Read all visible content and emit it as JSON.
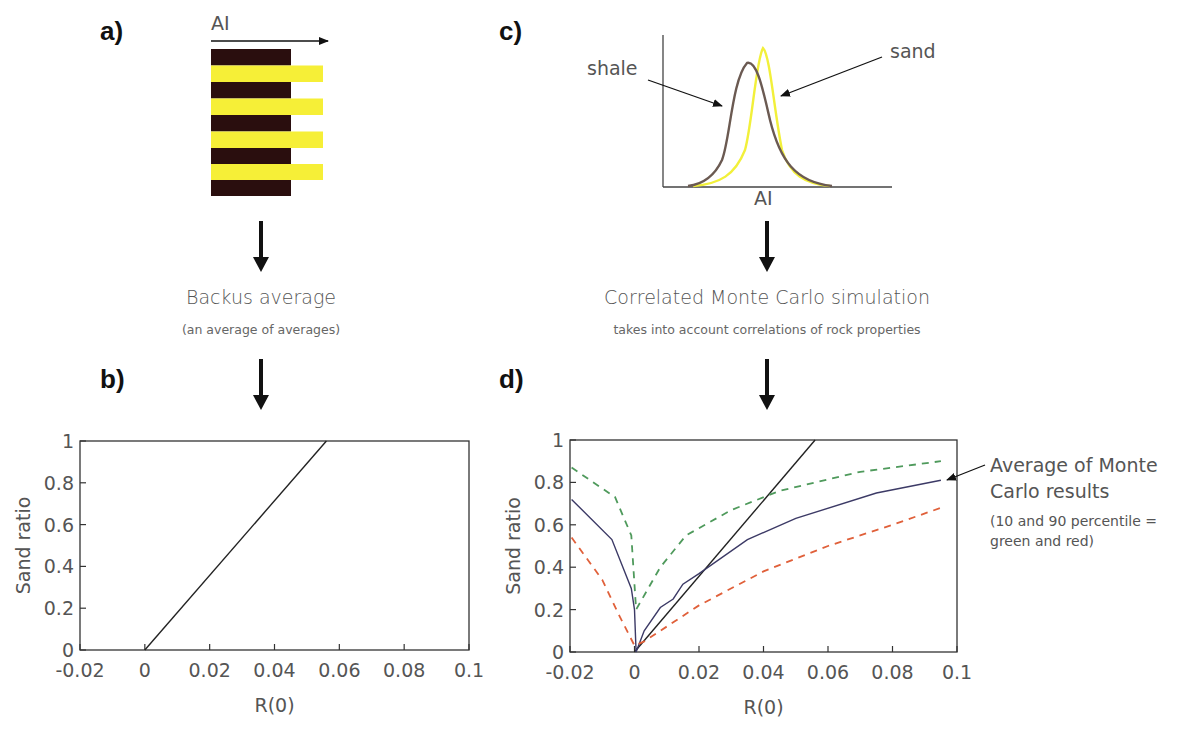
{
  "panels": {
    "a": {
      "label": "a)",
      "axis_label": "AI"
    },
    "b": {
      "label": "b)"
    },
    "c": {
      "label": "c)",
      "axis_label": "AI",
      "shale_label": "shale",
      "sand_label": "sand"
    },
    "d": {
      "label": "d)"
    }
  },
  "flow": {
    "left": {
      "title": "Backus average",
      "subtitle": "(an average of averages)"
    },
    "right": {
      "title": "Correlated Monte Carlo simulation",
      "subtitle": "takes into account correlations of rock properties"
    }
  },
  "annotation": {
    "line1": "Average of Monte",
    "line2": "Carlo results",
    "line3": "(10 and 90 percentile =",
    "line4": "green and red)"
  },
  "colors": {
    "shale": "#6b5a52",
    "sand": "#f2f03a",
    "dark_layer": "#2a0e0e",
    "yellow_layer": "#f6ef37",
    "avg_line": "#3c3a66",
    "p10_line": "#4f9a5c",
    "p90_line": "#e0603a",
    "backus_line": "#222222"
  },
  "chart_data": [
    {
      "id": "a",
      "type": "diagram",
      "title": "Layered shale/sand model",
      "xlabel": "AI",
      "layers": [
        "shale",
        "sand",
        "shale",
        "sand",
        "shale",
        "sand",
        "shale",
        "sand",
        "shale"
      ],
      "note": "Sand layers (yellow) have higher AI than shale layers (dark)"
    },
    {
      "id": "b",
      "type": "line",
      "title": "Backus average",
      "xlabel": "R(0)",
      "ylabel": "Sand ratio",
      "xlim": [
        -0.02,
        0.1
      ],
      "ylim": [
        0,
        1
      ],
      "xticks": [
        "-0.02",
        "0",
        "0.02",
        "0.04",
        "0.06",
        "0.08",
        "0.1"
      ],
      "yticks": [
        "0",
        "0.2",
        "0.4",
        "0.6",
        "0.8",
        "1"
      ],
      "series": [
        {
          "name": "Backus average",
          "style": "solid",
          "color": "#222222",
          "x": [
            0,
            0.056
          ],
          "y": [
            0,
            1
          ]
        }
      ]
    },
    {
      "id": "c",
      "type": "line",
      "title": "AI distributions",
      "xlabel": "AI",
      "ylabel": "",
      "series": [
        {
          "name": "shale",
          "color": "#6b5a52",
          "peak_relative_x": 0.37,
          "peak_relative_height": 0.83
        },
        {
          "name": "sand",
          "color": "#f2f03a",
          "peak_relative_x": 0.44,
          "peak_relative_height": 0.92
        }
      ]
    },
    {
      "id": "d",
      "type": "line",
      "title": "Correlated Monte Carlo simulation",
      "xlabel": "R(0)",
      "ylabel": "Sand ratio",
      "xlim": [
        -0.02,
        0.1
      ],
      "ylim": [
        0,
        1
      ],
      "xticks": [
        "-0.02",
        "0",
        "0.02",
        "0.04",
        "0.06",
        "0.08",
        "0.1"
      ],
      "yticks": [
        "0",
        "0.2",
        "0.4",
        "0.6",
        "0.8",
        "1"
      ],
      "series": [
        {
          "name": "Backus average",
          "style": "solid",
          "color": "#222222",
          "x": [
            0,
            0.056
          ],
          "y": [
            0,
            1
          ]
        },
        {
          "name": "Average of Monte Carlo results",
          "style": "solid",
          "color": "#3c3a66",
          "x": [
            -0.0195,
            -0.007,
            -0.001,
            0,
            0.0005,
            0.003,
            0.008,
            0.012,
            0.015,
            0.02,
            0.035,
            0.05,
            0.075,
            0.095
          ],
          "y": [
            0.72,
            0.53,
            0.3,
            0.2,
            0.0,
            0.1,
            0.21,
            0.25,
            0.32,
            0.37,
            0.53,
            0.63,
            0.75,
            0.81
          ]
        },
        {
          "name": "10 percentile",
          "style": "dashed",
          "color": "#4f9a5c",
          "x": [
            -0.0195,
            -0.006,
            -0.001,
            0.0005,
            0.008,
            0.016,
            0.03,
            0.045,
            0.07,
            0.095
          ],
          "y": [
            0.87,
            0.73,
            0.55,
            0.2,
            0.4,
            0.55,
            0.67,
            0.76,
            0.85,
            0.9
          ]
        },
        {
          "name": "90 percentile",
          "style": "dashed",
          "color": "#e0603a",
          "x": [
            -0.0195,
            -0.01,
            -0.005,
            0,
            0.003,
            0.02,
            0.04,
            0.06,
            0.08,
            0.095
          ],
          "y": [
            0.54,
            0.34,
            0.18,
            0.03,
            0.05,
            0.22,
            0.38,
            0.5,
            0.6,
            0.68
          ]
        }
      ]
    }
  ]
}
